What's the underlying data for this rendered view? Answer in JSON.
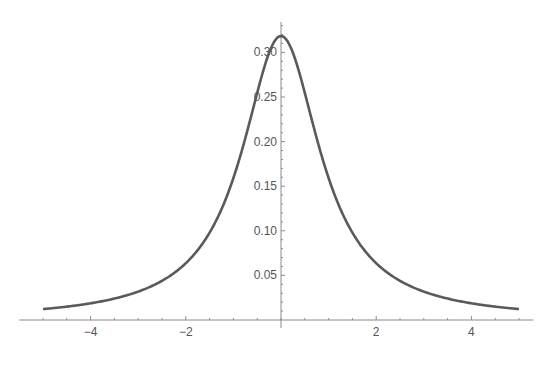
{
  "chart_data": {
    "type": "line",
    "title": "",
    "xlabel": "",
    "ylabel": "",
    "xlim": [
      -5,
      5
    ],
    "ylim": [
      0,
      0.32
    ],
    "grid": false,
    "legend": null,
    "function": "1/(pi*(1+x^2))",
    "x_ticks": [
      -4,
      -2,
      2,
      4
    ],
    "x_tick_labels": [
      "−4",
      "−2",
      "2",
      "4"
    ],
    "y_ticks": [
      0.05,
      0.1,
      0.15,
      0.2,
      0.25,
      0.3
    ],
    "y_tick_labels": [
      "0.05",
      "0.10",
      "0.15",
      "0.20",
      "0.25",
      "0.30"
    ],
    "series": [
      {
        "name": "density",
        "x": [
          -5,
          -4,
          -3,
          -2,
          -1.5,
          -1,
          -0.5,
          0,
          0.5,
          1,
          1.5,
          2,
          3,
          4,
          5
        ],
        "values": [
          0.0122,
          0.0187,
          0.0318,
          0.0637,
          0.0979,
          0.1592,
          0.2546,
          0.3183,
          0.2546,
          0.1592,
          0.0979,
          0.0637,
          0.0318,
          0.0187,
          0.0122
        ]
      }
    ],
    "colors": {
      "curve": "#5a5a5a",
      "axis": "#8a8a8a",
      "text": "#555555"
    }
  }
}
